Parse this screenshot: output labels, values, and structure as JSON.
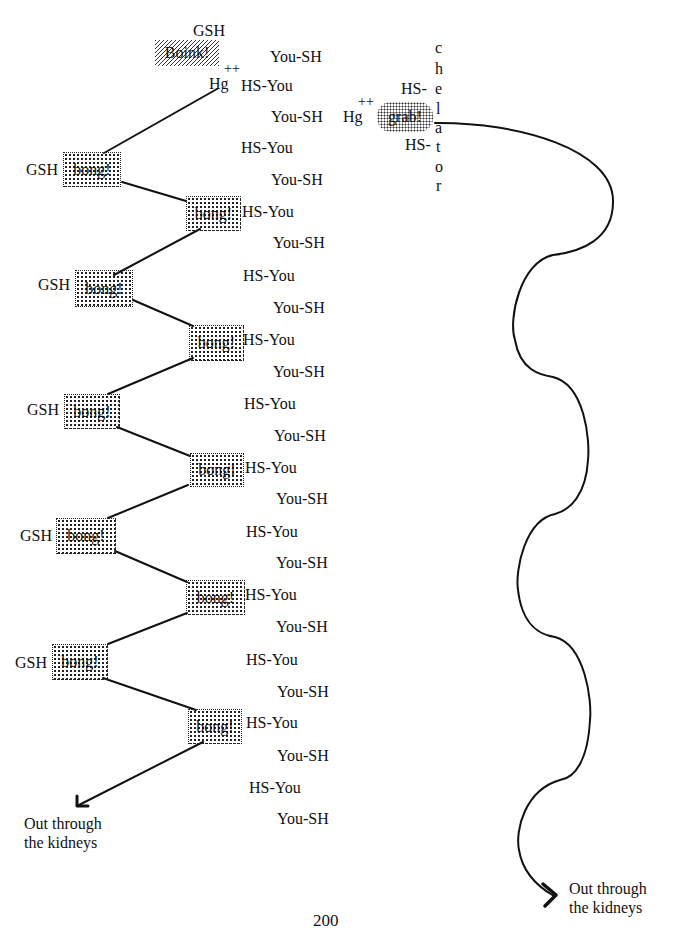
{
  "page_number": "200",
  "top": {
    "gsh_label": "GSH",
    "boink_label": "Boink!",
    "hg_label": "Hg",
    "hg_charge": "++"
  },
  "center_column": {
    "you_sh": [
      "You-SH",
      "You-SH",
      "You-SH",
      "You-SH",
      "You-SH",
      "You-SH",
      "You-SH",
      "You-SH",
      "You-SH",
      "You-SH",
      "You-SH",
      "You-SH",
      "You-SH"
    ],
    "hs_you": [
      "HS-You",
      "HS-You",
      "HS-You",
      "HS-You",
      "HS-You",
      "HS-You",
      "HS-You",
      "HS-You",
      "HS-You",
      "HS-You",
      "HS-You",
      "HS-You"
    ]
  },
  "left_bongs": [
    {
      "gsh": "GSH",
      "label": "bong!"
    },
    {
      "gsh": "GSH",
      "label": "bong!"
    },
    {
      "gsh": "GSH",
      "label": "bong!"
    },
    {
      "gsh": "GSH",
      "label": "bong!"
    },
    {
      "gsh": "GSH",
      "label": "bong!"
    }
  ],
  "right_bongs": [
    {
      "label": "bong!"
    },
    {
      "label": "bong!"
    },
    {
      "label": "bong!"
    },
    {
      "label": "bong!"
    },
    {
      "label": "bong!"
    }
  ],
  "chelator": {
    "hg_label": "Hg",
    "hg_charge": "++",
    "grab_label": "grab!",
    "hs_top": "HS-",
    "hs_bottom": "HS-",
    "letters": [
      "c",
      "h",
      "e",
      "l",
      "a",
      "t",
      "o",
      "r"
    ]
  },
  "exits": {
    "left": {
      "line1": "Out through",
      "line2": "the kidneys"
    },
    "right": {
      "line1": "Out through",
      "line2": "the kidneys"
    }
  }
}
